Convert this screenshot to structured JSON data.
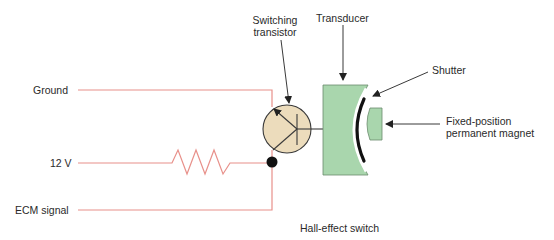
{
  "title": "Hall-effect switch",
  "labels": {
    "ground": "Ground",
    "v12": "12 V",
    "ecm_signal": "ECM signal",
    "switching_transistor_line1": "Switching",
    "switching_transistor_line2": "transistor",
    "transducer": "Transducer",
    "shutter": "Shutter",
    "magnet_line1": "Fixed-position",
    "magnet_line2": "permanent magnet",
    "caption": "Hall-effect switch"
  },
  "colors": {
    "wire": "#e8908a",
    "transistor_fill": "#ecdcbc",
    "transducer_fill": "#a9d6ad",
    "component_stroke": "#3a3a3a",
    "shutter": "#111111",
    "junction": "#111111",
    "text": "#2a2a2a"
  },
  "components": [
    {
      "name": "resistor",
      "connects": [
        "12 V",
        "junction"
      ]
    },
    {
      "name": "switching-transistor",
      "connects": [
        "Ground",
        "junction",
        "transducer"
      ]
    },
    {
      "name": "transducer"
    },
    {
      "name": "shutter"
    },
    {
      "name": "permanent-magnet"
    }
  ]
}
